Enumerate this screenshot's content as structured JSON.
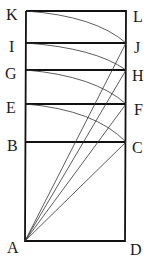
{
  "diagram": {
    "points": {
      "K": {
        "label": "K",
        "x": 26,
        "y": 11
      },
      "L": {
        "label": "L",
        "x": 126,
        "y": 11
      },
      "I": {
        "label": "I",
        "x": 26,
        "y": 43
      },
      "J": {
        "label": "J",
        "x": 126,
        "y": 43
      },
      "G": {
        "label": "G",
        "x": 26,
        "y": 70
      },
      "H": {
        "label": "H",
        "x": 126,
        "y": 70
      },
      "E": {
        "label": "E",
        "x": 26,
        "y": 104
      },
      "F": {
        "label": "F",
        "x": 126,
        "y": 104
      },
      "B": {
        "label": "B",
        "x": 26,
        "y": 142
      },
      "C": {
        "label": "C",
        "x": 126,
        "y": 142
      },
      "A": {
        "label": "A",
        "x": 25,
        "y": 241
      },
      "D": {
        "label": "D",
        "x": 125,
        "y": 241
      }
    },
    "horizontal_lines": [
      "IJ",
      "GH",
      "EF",
      "BC"
    ],
    "rays_from_A": [
      "C",
      "F",
      "H",
      "J"
    ],
    "arcs": [
      "K-J",
      "I-H",
      "G-F",
      "E-C"
    ]
  }
}
